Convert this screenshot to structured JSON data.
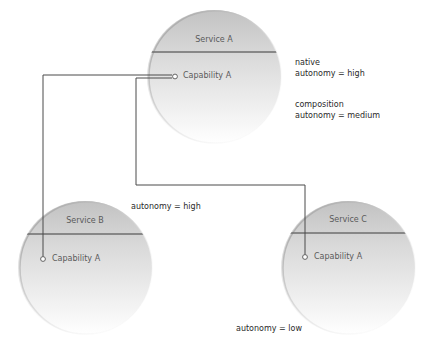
{
  "services": [
    {
      "id": "A",
      "title": "Service A",
      "capability": "Capability A",
      "cx": 214,
      "cy": 77,
      "r": 67
    },
    {
      "id": "B",
      "title": "Service B",
      "capability": "Capability A",
      "cx": 85,
      "cy": 268,
      "r": 67
    },
    {
      "id": "C",
      "title": "Service C",
      "capability": "Capability A",
      "cx": 348,
      "cy": 268,
      "r": 67
    }
  ],
  "annotations": {
    "service_a": {
      "native_label": "native",
      "native_autonomy": "autonomy = high",
      "composition_label": "composition",
      "composition_autonomy": "autonomy = medium"
    },
    "service_b": {
      "autonomy": "autonomy = high"
    },
    "service_c": {
      "autonomy": "autonomy = low"
    }
  },
  "colors": {
    "circle_top": "#c4c4c4",
    "circle_bottom": "#ffffff",
    "divider": "#6e6e6e",
    "connector": "#4a4a4a",
    "text": "#2a2a2a"
  }
}
